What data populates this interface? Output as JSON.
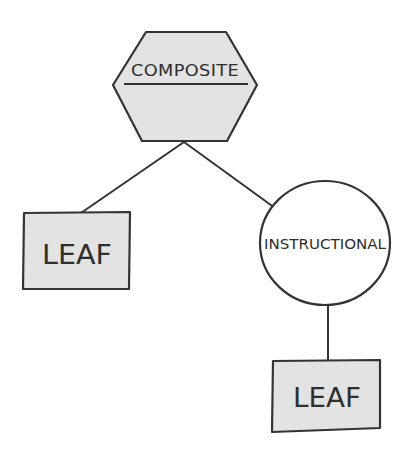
{
  "diagram": {
    "nodes": [
      {
        "id": "composite",
        "shape": "hexagon",
        "label": "COMPOSITE"
      },
      {
        "id": "leaf-left",
        "shape": "rectangle",
        "label": "LEAF"
      },
      {
        "id": "instructional",
        "shape": "circle",
        "label": "INSTRUCTIONAL"
      },
      {
        "id": "leaf-bottom",
        "shape": "rectangle",
        "label": "LEAF"
      }
    ],
    "edges": [
      {
        "from": "composite",
        "to": "leaf-left"
      },
      {
        "from": "composite",
        "to": "instructional"
      },
      {
        "from": "instructional",
        "to": "leaf-bottom"
      }
    ],
    "colors": {
      "fill": "#e3e3e3",
      "stroke": "#333333",
      "circle_fill": "#ffffff"
    }
  }
}
